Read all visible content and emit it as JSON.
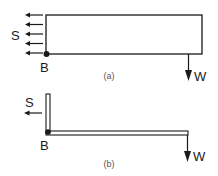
{
  "figure_a": {
    "caption": "(a)",
    "load_label": "S",
    "point_label": "B",
    "weight_label": "W",
    "shear_arrow_count": 5
  },
  "figure_b": {
    "caption": "(b)",
    "load_label": "S",
    "point_label": "B",
    "weight_label": "W"
  },
  "colors": {
    "stroke": "#1a1a1a",
    "background": "#ffffff"
  }
}
